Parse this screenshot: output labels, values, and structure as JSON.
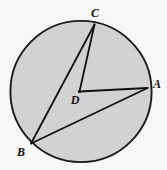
{
  "figure": {
    "background_color": "#f7f7f5",
    "fill_color": "#d2d2d2",
    "stroke_color": "#1a1a1a",
    "label_color": "#121212",
    "width": 167,
    "height": 170
  },
  "circle": {
    "center_label": "D",
    "cx": 81,
    "cy": 91.5,
    "r": 71.5,
    "stroke_width": 1.9
  },
  "points": {
    "A": {
      "label": "A",
      "x": 147.5,
      "y": 88,
      "label_x": 156,
      "label_y": 84
    },
    "B": {
      "label": "B",
      "x": 31,
      "y": 143.5,
      "label_x": 21,
      "label_y": 152
    },
    "C": {
      "label": "C",
      "x": 94.5,
      "y": 24,
      "label_x": 95,
      "label_y": 13
    },
    "D": {
      "label": "D",
      "x": 79.5,
      "y": 91.5,
      "label_x": 75,
      "label_y": 100
    }
  },
  "segments": [
    {
      "name": "radius-DC",
      "from": "D",
      "to": "C"
    },
    {
      "name": "radius-DA",
      "from": "D",
      "to": "A"
    },
    {
      "name": "chord-CB",
      "from": "C",
      "to": "B"
    },
    {
      "name": "chord-BA",
      "from": "B",
      "to": "A"
    }
  ],
  "labels": {
    "a": "A",
    "b": "B",
    "c": "C",
    "d": "D"
  }
}
